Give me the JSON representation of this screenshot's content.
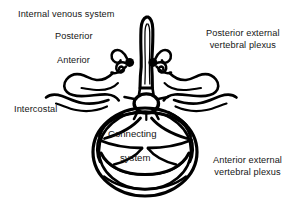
{
  "figure": {
    "background_color": "#ffffff",
    "ink_color": "#000000",
    "text_color": "#161616"
  },
  "labels": {
    "internal_venous_system": "Internal venous system",
    "posterior": "Posterior",
    "anterior": "Anterior",
    "posterior_external_line1": "Posterior external",
    "posterior_external_line2": "vertebral plexus",
    "intercostal": "Intercostal",
    "anterior_external_line1": "Anterior external",
    "anterior_external_line2": "vertebral plexus",
    "connecting": "Connecting",
    "system": "system"
  }
}
